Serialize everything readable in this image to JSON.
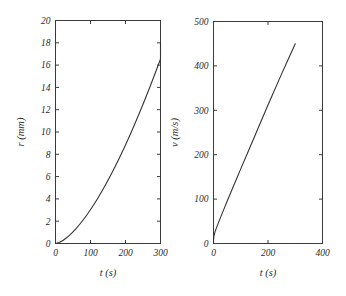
{
  "figure": {
    "background": "#ffffff",
    "line_color": "#333333",
    "axis_color": "#3a3a3a",
    "width": 346,
    "height": 296
  },
  "chart_data": [
    {
      "type": "line",
      "panel": "left",
      "title": "",
      "xlabel": "t (s)",
      "ylabel": "r (mm)",
      "xlim": [
        0,
        300
      ],
      "ylim": [
        0,
        20
      ],
      "xticks": [
        0,
        100,
        200,
        300
      ],
      "xticklabels": [
        "0",
        "100",
        "200",
        "300"
      ],
      "yticks": [
        0,
        2,
        4,
        6,
        8,
        10,
        12,
        14,
        16,
        18,
        20
      ],
      "yticklabels": [
        "0",
        "2",
        "4",
        "6",
        "8",
        "10",
        "12",
        "14",
        "16",
        "18",
        "20"
      ],
      "grid": false,
      "legend": null,
      "x": [
        0,
        15,
        30,
        45,
        60,
        75,
        90,
        105,
        120,
        135,
        150,
        165,
        180,
        195,
        210,
        225,
        240,
        255,
        270,
        285,
        300
      ],
      "y": [
        0.0,
        0.16,
        0.47,
        0.89,
        1.38,
        1.95,
        2.58,
        3.27,
        4.02,
        4.82,
        5.67,
        6.57,
        7.51,
        8.5,
        9.53,
        10.6,
        11.72,
        12.87,
        14.06,
        15.29,
        16.55
      ],
      "series": [
        {
          "name": "r(t)",
          "values": [
            0.0,
            0.16,
            0.47,
            0.89,
            1.38,
            1.95,
            2.58,
            3.27,
            4.02,
            4.82,
            5.67,
            6.57,
            7.51,
            8.5,
            9.53,
            10.6,
            11.72,
            12.87,
            14.06,
            15.29,
            16.55
          ]
        }
      ],
      "endpoint": {
        "x": 300,
        "y": 18.0
      }
    },
    {
      "type": "line",
      "panel": "right",
      "title": "",
      "xlabel": "t (s)",
      "ylabel": "v (m/s)",
      "xlim": [
        0,
        400
      ],
      "ylim": [
        0,
        500
      ],
      "xticks": [
        0,
        200,
        400
      ],
      "xticklabels": [
        "0",
        "200",
        "400"
      ],
      "yticks": [
        0,
        100,
        200,
        300,
        400,
        500
      ],
      "yticklabels": [
        "0",
        "100",
        "200",
        "300",
        "400",
        "500"
      ],
      "grid": false,
      "legend": null,
      "x": [
        0,
        5,
        50,
        100,
        150,
        200,
        250,
        300
      ],
      "y": [
        0,
        25,
        95,
        168,
        240,
        312,
        382,
        450
      ],
      "series": [
        {
          "name": "v(t)",
          "values": [
            0,
            25,
            95,
            168,
            240,
            312,
            382,
            450
          ]
        }
      ],
      "endpoint": {
        "x": 300,
        "y": 450
      }
    }
  ],
  "left_panel": {
    "xlabel": "t (s)",
    "ylabel": "r (mm)",
    "xticklabels": [
      "0",
      "100",
      "200",
      "300"
    ],
    "yticklabels": [
      "0",
      "2",
      "4",
      "6",
      "8",
      "10",
      "12",
      "14",
      "16",
      "18",
      "20"
    ]
  },
  "right_panel": {
    "xlabel": "t (s)",
    "ylabel": "v (m/s)",
    "xticklabels": [
      "0",
      "200",
      "400"
    ],
    "yticklabels": [
      "0",
      "100",
      "200",
      "300",
      "400",
      "500"
    ]
  }
}
